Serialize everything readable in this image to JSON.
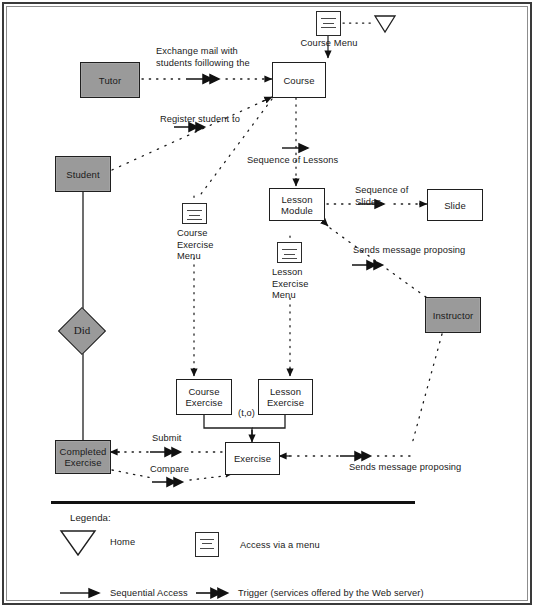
{
  "diagram": {
    "entities": [
      {
        "id": "tutor",
        "label": "Tutor",
        "kind": "actor"
      },
      {
        "id": "student",
        "label": "Student",
        "kind": "actor"
      },
      {
        "id": "instructor",
        "label": "Instructor",
        "kind": "actor"
      },
      {
        "id": "completed-exercise",
        "label": "Completed\nExercise",
        "kind": "actor"
      }
    ],
    "pages": [
      {
        "id": "course",
        "label": "Course"
      },
      {
        "id": "lesson-module",
        "label": "Lesson\nModule"
      },
      {
        "id": "slide",
        "label": "Slide"
      },
      {
        "id": "course-exercise",
        "label": "Course\nExercise"
      },
      {
        "id": "lesson-exercise",
        "label": "Lesson\nExercise"
      },
      {
        "id": "exercise",
        "label": "Exercise"
      }
    ],
    "relationship": {
      "id": "did",
      "label": "Did"
    },
    "menus": [
      {
        "id": "course-menu",
        "label": "Course Menu"
      },
      {
        "id": "course-exercise-menu",
        "label": "Course\nExercise\nMenu"
      },
      {
        "id": "lesson-exercise-menu",
        "label": "Lesson\nExercise\nMenu"
      }
    ],
    "edge_labels": [
      {
        "id": "exchange-mail",
        "text": "Exchange mail with\nstudents foillowing the"
      },
      {
        "id": "register-student",
        "text": "Register student to"
      },
      {
        "id": "sequence-of-lessons",
        "text": "Sequence of Lessons"
      },
      {
        "id": "sequence-of-slides",
        "text": "Sequence of\nSlides"
      },
      {
        "id": "sends-message-top",
        "text": "Sends message proposing"
      },
      {
        "id": "sends-message-bottom",
        "text": "Sends message proposing"
      },
      {
        "id": "submit",
        "text": "Submit"
      },
      {
        "id": "compare",
        "text": "Compare"
      },
      {
        "id": "cardinality",
        "text": "(t,o)"
      }
    ],
    "legend": {
      "heading": "Legenda:",
      "items": [
        {
          "id": "home",
          "symbol": "home-triangle-icon",
          "label": "Home"
        },
        {
          "id": "access-via-menu",
          "symbol": "menu-icon",
          "label": "Access via a menu"
        },
        {
          "id": "sequential-access",
          "symbol": "single-arrow-icon",
          "label": "Sequential Access"
        },
        {
          "id": "trigger",
          "symbol": "double-arrow-icon",
          "label": "Trigger (services offered by the Web server)"
        }
      ]
    },
    "colors": {
      "entity_fill": "#9a9a9a",
      "stroke": "#1f1f1f",
      "page_fill": "#ffffff",
      "background": "#ffffff"
    }
  }
}
